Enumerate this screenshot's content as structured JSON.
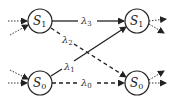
{
  "diagram": {
    "nodes": [
      {
        "id": "left-s1",
        "label": "S",
        "sub": "1",
        "cx": 40,
        "cy": 21
      },
      {
        "id": "right-s1",
        "label": "S",
        "sub": "1",
        "cx": 137,
        "cy": 21
      },
      {
        "id": "left-s0",
        "label": "S",
        "sub": "0",
        "cx": 40,
        "cy": 83
      },
      {
        "id": "right-s0",
        "label": "S",
        "sub": "0",
        "cx": 137,
        "cy": 83
      }
    ],
    "edges": [
      {
        "from": "left-s1",
        "to": "right-s1",
        "label": "λ",
        "sub": "3",
        "style": "solid"
      },
      {
        "from": "left-s1",
        "to": "right-s0",
        "label": "λ",
        "sub": "2",
        "style": "dashed"
      },
      {
        "from": "left-s0",
        "to": "right-s1",
        "label": "λ",
        "sub": "1",
        "style": "solid"
      },
      {
        "from": "left-s0",
        "to": "right-s0",
        "label": "λ",
        "sub": "0",
        "style": "dashed"
      }
    ],
    "node_radius": 12,
    "colors": {
      "stroke": "#222222",
      "background": "#ffffff"
    }
  }
}
